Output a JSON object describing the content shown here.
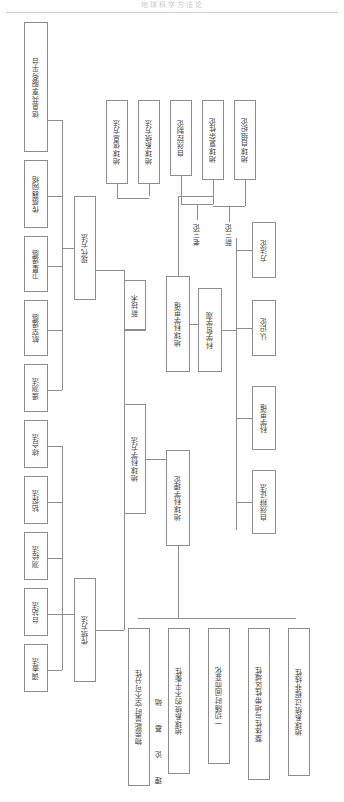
{
  "page": {
    "header_title": "地球科学方法论",
    "background_color": "#fefefe",
    "line_color": "#8d8d8d"
  },
  "captions": {
    "theory_basis": "理 论 基 础",
    "old_three_theories": "老三论",
    "new_three_theories": "新三论"
  },
  "nodes": {
    "root_methods": "地球科学方法",
    "root_theory": "地球科学理论",
    "modern_methods": "现代方法",
    "traditional_methods": "传统方法",
    "new_technology": "新技术",
    "geoscience_thinking": "地球科学思维",
    "philosophy_view": "科学哲学观",
    "info_sharing_platform": "信息共享服务平台",
    "sensor_network": "传感器网络",
    "satellite_remote_sensing": "卫星遥感",
    "aerial_remote_sensing": "航空遥感",
    "remote_measure_method": "遥测法",
    "comprehensive_method": "综合法",
    "drilling_method": "钻探法",
    "survey_mapping_method": "测绘法",
    "station_method": "台站法",
    "investigation_method": "调查法",
    "earth_info_method": "地球信息方法",
    "earth_system_method": "地球系统方法",
    "natural_cybernetics": "自然控制论",
    "earth_complexity_theory": "地球复杂性论",
    "earth_self_organization": "地球自组织论",
    "methodology": "方法论",
    "epistemology": "认识论",
    "scientific_thinking": "科学思维",
    "natural_dialectics": "自然辩证法",
    "matter_energy_spacetime": "物质能量时空不可分性",
    "earth_system_imbalance": "地球系统的不平衡性",
    "change_over_time": "一切随时间而变化",
    "holism_zonality_regionality": "整体性与地带性区域性",
    "earth_system_nonlinearity": "地球系统过程非线性"
  }
}
